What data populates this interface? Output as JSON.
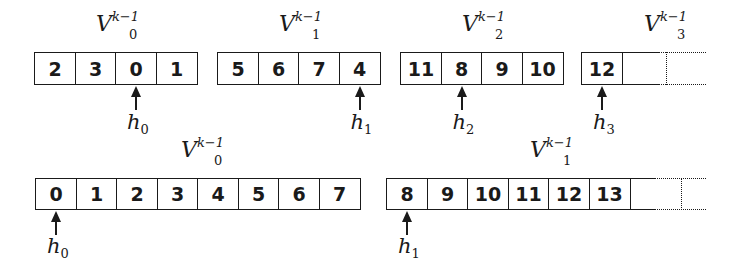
{
  "diagram": {
    "top_row": {
      "vectors": [
        {
          "name": "V",
          "sub": "0",
          "sup": "k−1",
          "cells": [
            "2",
            "3",
            "0",
            "1"
          ],
          "head": "h",
          "head_sub": "0",
          "head_index": 2
        },
        {
          "name": "V",
          "sub": "1",
          "sup": "k−1",
          "cells": [
            "5",
            "6",
            "7",
            "4"
          ],
          "head": "h",
          "head_sub": "1",
          "head_index": 3
        },
        {
          "name": "V",
          "sub": "2",
          "sup": "k−1",
          "cells": [
            "11",
            "8",
            "9",
            "10"
          ],
          "head": "h",
          "head_sub": "2",
          "head_index": 1
        },
        {
          "name": "V",
          "sub": "3",
          "sup": "k−1",
          "cells": [
            "12"
          ],
          "head": "h",
          "head_sub": "3",
          "head_index": 0,
          "open_ended": true
        }
      ]
    },
    "bottom_row": {
      "vectors": [
        {
          "name": "V",
          "sub": "0",
          "sup": "k−1",
          "cells": [
            "0",
            "1",
            "2",
            "3",
            "4",
            "5",
            "6",
            "7"
          ],
          "head": "h",
          "head_sub": "0",
          "head_index": 0
        },
        {
          "name": "V",
          "sub": "1",
          "sup": "k−1",
          "cells": [
            "8",
            "9",
            "10",
            "11",
            "12",
            "13"
          ],
          "head": "h",
          "head_sub": "1",
          "head_index": 0,
          "open_ended": true
        }
      ]
    }
  }
}
